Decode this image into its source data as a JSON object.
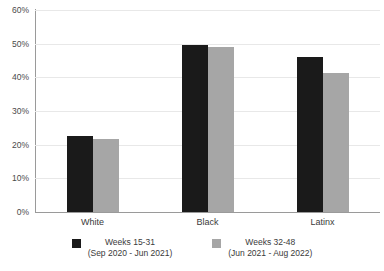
{
  "chart_data": {
    "type": "bar",
    "title": "",
    "subtitle": "",
    "xlabel": "",
    "ylabel": "",
    "categories": [
      "White",
      "Black",
      "Latinx"
    ],
    "series": [
      {
        "name": "Weeks 15-31",
        "name_line2": "(Sep 2020 - Jun 2021)",
        "color": "#1A1A1A",
        "values": [
          22.6,
          49.6,
          46.0
        ]
      },
      {
        "name": "Weeks 32-48",
        "name_line2": "(Jun 2021 - Aug 2022)",
        "color": "#A6A6A6",
        "values": [
          21.7,
          49.1,
          41.4
        ]
      }
    ],
    "ylim": [
      0,
      60
    ],
    "ytick_step": 10,
    "ytick_labels": [
      "0%",
      "10%",
      "20%",
      "30%",
      "40%",
      "50%",
      "60%"
    ],
    "ytick_values": [
      0,
      10,
      20,
      30,
      40,
      50,
      60
    ],
    "grid": true,
    "grid_axis": "y",
    "legend_position": "bottom",
    "value_format": "percent"
  },
  "colors": {
    "series_1": "#1A1A1A",
    "series_2": "#A6A6A6",
    "gridline": "#E8E8E8",
    "axis": "#9A9A9A",
    "text": "#3A3A3A",
    "background": "#FFFFFF"
  }
}
